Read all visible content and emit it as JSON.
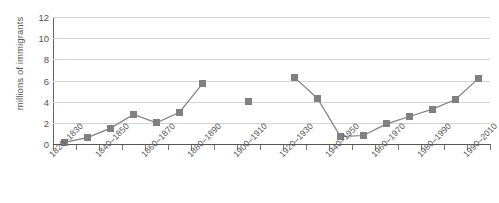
{
  "chart_data": {
    "type": "line",
    "title": "",
    "subtitle": "",
    "xlabel": "",
    "ylabel": "millions of immigrants",
    "categories": [
      "1820–1830",
      "1830–1840",
      "1840–1850",
      "1850–1860",
      "1860–1870",
      "1870–1880",
      "1880–1890",
      "1890–1900",
      "1900–1910",
      "1910–1920",
      "1920–1930",
      "1930–1940",
      "1940–1950",
      "1950–1960",
      "1960–1970",
      "1970–1980",
      "1980–1990",
      "1990–2000",
      "2000–2010"
    ],
    "values": [
      0.15,
      0.6,
      1.5,
      2.8,
      2.0,
      3.0,
      5.7,
      null,
      4.0,
      null,
      6.3,
      4.3,
      0.7,
      0.8,
      1.9,
      2.6,
      3.3,
      4.2,
      6.2
    ],
    "ylim": [
      0,
      12
    ],
    "yticks": [
      0,
      2,
      4,
      6,
      8,
      10,
      12
    ],
    "xtick_labels": [
      "1820–1830",
      "1840–1850",
      "1860–1870",
      "1880–1890",
      "1900–1910",
      "1920–1930",
      "1940–1950",
      "1960–1970",
      "1980–1990",
      "1990–2010"
    ],
    "xtick_label_indices": [
      0,
      2,
      4,
      6,
      8,
      10,
      12,
      14,
      16,
      18
    ],
    "grid": "horizontal",
    "legend": null,
    "series_color": "#808080",
    "grid_color": "#d4d4d4",
    "axis_color": "#555555",
    "marker": "square"
  }
}
